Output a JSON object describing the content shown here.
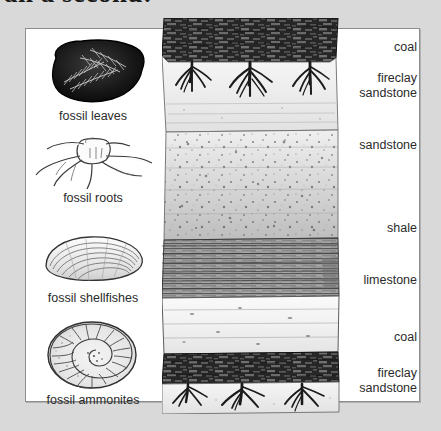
{
  "heading": {
    "text": "an a seconu:"
  },
  "figure": {
    "background_color": "#d9d9d9",
    "panel_color": "#ffffff",
    "border_color": "#8d8d8d"
  },
  "fossils": [
    {
      "id": "fossil-leaves",
      "caption": "fossil leaves",
      "icon": "fossil-leaves-icon",
      "top": 6,
      "art_height": 72
    },
    {
      "id": "fossil-roots",
      "caption": "fossil roots",
      "icon": "fossil-roots-icon",
      "top": 104,
      "art_height": 56
    },
    {
      "id": "fossil-shellfishes",
      "caption": "fossil shellfishes",
      "icon": "fossil-shellfish-icon",
      "top": 198,
      "art_height": 62
    },
    {
      "id": "fossil-ammonites",
      "caption": "fossil ammonites",
      "icon": "fossil-ammonite-icon",
      "top": 288,
      "art_height": 74
    }
  ],
  "strata": [
    {
      "id": "coal-upper",
      "label": "coal",
      "pattern": "coal",
      "top": 0,
      "height": 44,
      "color": "#3a3a3a"
    },
    {
      "id": "fireclay-sandstone-upper",
      "label": "fireclay\nsandstone",
      "label_line1": "fireclay",
      "label_line2": "sandstone",
      "pattern": "fireclay-with-roots",
      "top": 44,
      "height": 72,
      "color": "#efefef"
    },
    {
      "id": "sandstone-middle",
      "label": "sandstone",
      "pattern": "sandstone-speckled",
      "top": 116,
      "height": 104,
      "color": "#e3e3e3"
    },
    {
      "id": "shale",
      "label": "shale",
      "pattern": "shale-laminated",
      "top": 220,
      "height": 60,
      "color": "#9a9a9a"
    },
    {
      "id": "limestone",
      "label": "limestone",
      "pattern": "limestone-blocky",
      "top": 280,
      "height": 56,
      "color": "#f2f2f2"
    },
    {
      "id": "coal-lower",
      "label": "coal",
      "pattern": "coal",
      "top": 336,
      "height": 30,
      "color": "#3a3a3a"
    },
    {
      "id": "fireclay-sandstone-lower",
      "label": "fireclay\nsandstone",
      "label_line1": "fireclay",
      "label_line2": "sandstone",
      "pattern": "fireclay-with-roots",
      "top": 366,
      "height": 30,
      "color": "#efefef"
    }
  ],
  "rock_labels": [
    {
      "id": "label-coal-upper",
      "text": "coal",
      "top": 12
    },
    {
      "id": "label-fireclay-upper-1",
      "text": "fireclay",
      "top": 43
    },
    {
      "id": "label-fireclay-upper-2",
      "text": "sandstone",
      "top": 58
    },
    {
      "id": "label-sandstone",
      "text": "sandstone",
      "top": 110
    },
    {
      "id": "label-shale",
      "text": "shale",
      "top": 193
    },
    {
      "id": "label-limestone",
      "text": "limestone",
      "top": 245
    },
    {
      "id": "label-coal-lower",
      "text": "coal",
      "top": 302
    },
    {
      "id": "label-fireclay-lower-1",
      "text": "fireclay",
      "top": 338
    },
    {
      "id": "label-fireclay-lower-2",
      "text": "sandstone",
      "top": 353
    }
  ]
}
